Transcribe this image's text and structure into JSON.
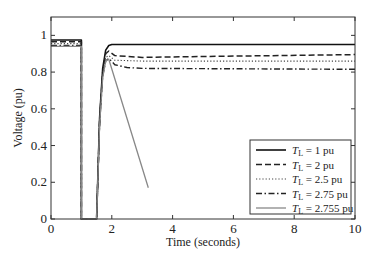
{
  "chart_data": {
    "type": "line",
    "title": "",
    "xlabel": "Time (seconds)",
    "ylabel": "Voltage (pu)",
    "xlim": [
      0,
      10
    ],
    "ylim": [
      0,
      1.1
    ],
    "xticks": [
      0,
      2,
      4,
      6,
      8,
      10
    ],
    "yticks": [
      0,
      0.2,
      0.4,
      0.6,
      0.8,
      1
    ],
    "grid": false,
    "legend_position": "lower right",
    "series": [
      {
        "name": "T_L = 1 pu",
        "legend_label": {
          "main": "T",
          "sub": "L",
          "rest": " = 1 pu"
        },
        "style": "solid",
        "color": "#111111",
        "width": 1.6,
        "x": [
          0,
          1.0,
          1.0,
          1.5,
          1.5,
          1.6,
          1.7,
          1.8,
          1.9,
          2.0,
          2.2,
          3,
          10
        ],
        "y": [
          0.975,
          0.975,
          0,
          0,
          0,
          0.55,
          0.82,
          0.92,
          0.945,
          0.95,
          0.95,
          0.95,
          0.95
        ]
      },
      {
        "name": "T_L = 2 pu",
        "legend_label": {
          "main": "T",
          "sub": "L",
          "rest": " = 2 pu"
        },
        "style": "dashed",
        "color": "#222222",
        "width": 1.5,
        "x": [
          0,
          1.0,
          1.0,
          1.5,
          1.5,
          1.6,
          1.7,
          1.8,
          1.9,
          2.1,
          3,
          5,
          10
        ],
        "y": [
          0.965,
          0.965,
          0,
          0,
          0,
          0.54,
          0.8,
          0.9,
          0.915,
          0.89,
          0.88,
          0.885,
          0.895
        ]
      },
      {
        "name": "T_L = 2.5 pu",
        "legend_label": {
          "main": "T",
          "sub": "L",
          "rest": " = 2.5 pu"
        },
        "style": "dotted",
        "color": "#444444",
        "width": 1.1,
        "x": [
          0,
          1.0,
          1.0,
          1.5,
          1.5,
          1.6,
          1.7,
          1.8,
          1.9,
          2.1,
          3,
          10
        ],
        "y": [
          0.955,
          0.955,
          0,
          0,
          0,
          0.53,
          0.79,
          0.88,
          0.89,
          0.865,
          0.86,
          0.86
        ]
      },
      {
        "name": "T_L = 2.75 pu",
        "legend_label": {
          "main": "T",
          "sub": "L",
          "rest": " = 2.75 pu"
        },
        "style": "dashdot",
        "color": "#222222",
        "width": 1.4,
        "x": [
          0,
          1.0,
          1.0,
          1.5,
          1.5,
          1.6,
          1.7,
          1.8,
          1.9,
          2.1,
          2.5,
          3,
          10
        ],
        "y": [
          0.945,
          0.945,
          0,
          0,
          0,
          0.52,
          0.78,
          0.86,
          0.875,
          0.84,
          0.825,
          0.82,
          0.815
        ]
      },
      {
        "name": "T_L = 2.755 pu",
        "legend_label": {
          "main": "T",
          "sub": "L",
          "rest": " = 2.755 pu"
        },
        "style": "solid",
        "color": "#888888",
        "width": 1.3,
        "x": [
          0,
          1.0,
          1.0,
          1.5,
          1.5,
          1.6,
          1.7,
          1.8,
          1.9,
          3.2
        ],
        "y": [
          0.94,
          0.94,
          0,
          0,
          0,
          0.51,
          0.77,
          0.86,
          0.87,
          0.17
        ]
      }
    ]
  },
  "axes": {
    "xlabel": "Time (seconds)",
    "ylabel": "Voltage (pu)",
    "xtick_labels": [
      "0",
      "2",
      "4",
      "6",
      "8",
      "10"
    ],
    "ytick_labels": [
      "0",
      "0.2",
      "0.4",
      "0.6",
      "0.8",
      "1"
    ]
  }
}
